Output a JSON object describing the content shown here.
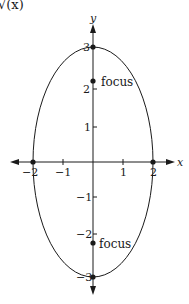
{
  "figure": {
    "top_fragment": "√(x)",
    "x_axis_label": "x",
    "y_axis_label": "y",
    "x_ticks": [
      {
        "label": "−2",
        "value": -2
      },
      {
        "label": "−1",
        "value": -1
      },
      {
        "label": "1",
        "value": 1
      },
      {
        "label": "2",
        "value": 2
      }
    ],
    "y_ticks": [
      {
        "label": "3",
        "value": 3
      },
      {
        "label": "2",
        "value": 2
      },
      {
        "label": "1",
        "value": 1
      },
      {
        "label": "−1",
        "value": -1
      },
      {
        "label": "−2",
        "value": -2
      },
      {
        "label": "−3",
        "value": -3
      }
    ],
    "focus_top_label": "focus",
    "focus_bottom_label": "focus",
    "ellipse": {
      "center": [
        0,
        0
      ],
      "semi_x": 2,
      "semi_y": 3
    },
    "points": [
      {
        "name": "vertex-top",
        "x": 0,
        "y": 3
      },
      {
        "name": "vertex-bottom",
        "x": 0,
        "y": -3
      },
      {
        "name": "co-vertex-left",
        "x": -2,
        "y": 0
      },
      {
        "name": "co-vertex-right",
        "x": 2,
        "y": 0
      },
      {
        "name": "focus-top",
        "x": 0,
        "y": 2.236
      },
      {
        "name": "focus-bottom",
        "x": 0,
        "y": -2.236
      }
    ],
    "stroke_color": "#1a1a1a"
  }
}
